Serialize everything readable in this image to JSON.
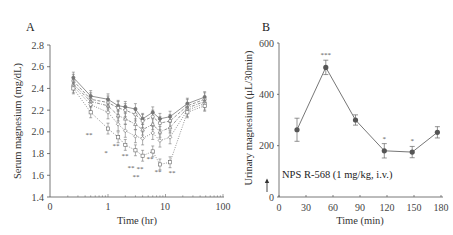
{
  "panels": {
    "a": {
      "label": "A"
    },
    "b": {
      "label": "B"
    }
  },
  "chart_data": [
    {
      "type": "line",
      "panel": "A",
      "title": "",
      "xlabel": "Time (hr)",
      "ylabel": "Serum magnesium (mg/dL)",
      "xscale": "log",
      "xticks": [
        "0",
        "1",
        "10",
        "100"
      ],
      "yticks": [
        "1.4",
        "1.6",
        "1.8",
        "2.0",
        "2.2",
        "2.4",
        "2.6",
        "2.8"
      ],
      "ylim": [
        1.4,
        2.8
      ],
      "x": [
        0.25,
        0.5,
        1,
        1.5,
        2,
        3,
        4,
        6,
        8,
        12,
        24,
        48
      ],
      "series": [
        {
          "name": "group 1 (solid)",
          "style": "solid",
          "values": [
            2.5,
            2.33,
            2.3,
            2.24,
            2.23,
            2.21,
            2.12,
            2.18,
            2.12,
            2.14,
            2.26,
            2.32
          ]
        },
        {
          "name": "group 2 (dashed)",
          "style": "dashed",
          "values": [
            2.47,
            2.3,
            2.27,
            2.22,
            2.2,
            2.16,
            2.1,
            2.14,
            2.08,
            2.1,
            2.24,
            2.3
          ]
        },
        {
          "name": "group 3 (dash-dot)",
          "style": "dashdot",
          "values": [
            2.44,
            2.28,
            2.24,
            2.15,
            2.12,
            2.07,
            2.02,
            2.07,
            2.0,
            2.04,
            2.22,
            2.28
          ]
        },
        {
          "name": "group 4 (dotted)",
          "style": "dotted",
          "values": [
            2.42,
            2.25,
            2.18,
            2.07,
            2.01,
            1.96,
            1.94,
            1.99,
            1.92,
            1.95,
            2.2,
            2.26
          ]
        },
        {
          "name": "group 5 (dotted, squares)",
          "style": "dotted",
          "values": [
            2.4,
            2.18,
            2.03,
            1.95,
            1.88,
            1.83,
            1.78,
            1.82,
            1.7,
            1.72,
            2.18,
            2.24
          ]
        }
      ],
      "annotations": [
        "**",
        "*",
        "**",
        "**",
        "**",
        "**",
        "**",
        "**",
        "**",
        "**"
      ]
    },
    {
      "type": "line",
      "panel": "B",
      "title": "",
      "xlabel": "Time (min)",
      "ylabel": "Urinary magnesium (μL/30min)",
      "xticks": [
        "0",
        "30",
        "60",
        "90",
        "120",
        "150",
        "180"
      ],
      "yticks": [
        "0",
        "200",
        "400",
        "600"
      ],
      "ylim": [
        0,
        600
      ],
      "xlim": [
        0,
        180
      ],
      "x": [
        20,
        52,
        85,
        117,
        148,
        176
      ],
      "values": [
        262,
        505,
        300,
        180,
        175,
        252
      ],
      "errors": [
        45,
        28,
        20,
        28,
        22,
        22
      ],
      "significance": [
        "",
        "***",
        "",
        "*",
        "*",
        ""
      ],
      "annotation_text": "NPS R-568 (1 mg/kg, i.v.)",
      "arrow_at": 0
    }
  ],
  "text": {
    "a_xlabel": "Time (hr)",
    "a_ylabel": "Serum magnesium (mg/dL)",
    "b_xlabel": "Time (min)",
    "b_ylabel": "Urinary magnesium (μL/30min)",
    "b_annotation": "NPS R-568 (1 mg/kg, i.v.)"
  }
}
